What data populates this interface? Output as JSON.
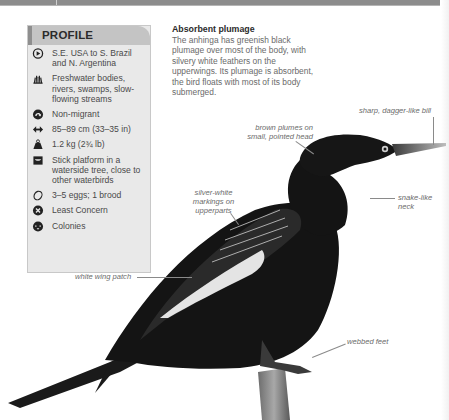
{
  "profile": {
    "title": "PROFILE",
    "items": [
      {
        "icon": "range-globe-icon",
        "text": "S.E. USA to S. Brazil and N. Argentina"
      },
      {
        "icon": "habitat-reeds-icon",
        "text": "Freshwater bodies, rivers, swamps, slow-flowing streams"
      },
      {
        "icon": "migration-arrow-icon",
        "text": "Non-migrant"
      },
      {
        "icon": "length-arrows-icon",
        "text": "85–89 cm (33–35 in)"
      },
      {
        "icon": "weight-icon",
        "text": "1.2 kg (2¾ lb)"
      },
      {
        "icon": "nest-icon",
        "text": "Stick platform in a waterside tree, close to other waterbirds"
      },
      {
        "icon": "egg-icon",
        "text": "3–5 eggs; 1 brood"
      },
      {
        "icon": "conservation-status-icon",
        "text": "Least Concern"
      },
      {
        "icon": "social-colonies-icon",
        "text": "Colonies"
      }
    ]
  },
  "description": {
    "heading": "Absorbent plumage",
    "body": "The anhinga has greenish black plumage over most of the body, with silvery white feathers on the upperwings. Its plumage is absorbent, the bird floats with most of its body submerged."
  },
  "annotations": {
    "bill": "sharp, dagger-like bill",
    "head": "brown plumes on small, pointed head",
    "neck": "snake-like neck",
    "markings": "silver-white markings on upperparts",
    "wing_patch": "white wing patch",
    "feet": "webbed feet"
  },
  "colors": {
    "profile_bg": "#e9e9e9",
    "profile_header": "#c4c4c4",
    "text": "#4a4a4a",
    "bird": "#141414"
  }
}
